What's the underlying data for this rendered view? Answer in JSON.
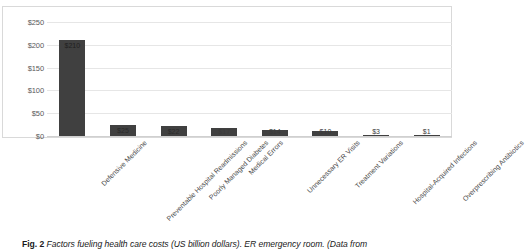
{
  "chart_data": {
    "type": "bar",
    "title": "",
    "xlabel": "",
    "ylabel": "",
    "ylim": [
      0,
      250
    ],
    "grid": true,
    "legend": "none",
    "y_ticks": [
      "$0",
      "$50",
      "$100",
      "$150",
      "$200",
      "$250"
    ],
    "y_tick_values": [
      0,
      50,
      100,
      150,
      200,
      250
    ],
    "categories": [
      "Defensive Medicine",
      "Preventable Hospital Readmissions",
      "Poorly Managed Diabetes",
      "Medical Errors",
      "Unnecessary ER Visits",
      "Treatment Variations",
      "Hospital-Acquired Infections",
      "Overprescribing Antibiotics"
    ],
    "values": [
      210,
      25,
      22,
      17,
      14,
      10,
      3,
      1
    ],
    "data_labels": [
      "$210",
      "$25",
      "$22",
      "$17",
      "$14",
      "$10",
      "$3",
      "$1"
    ],
    "bar_color": "#404040",
    "grid_color": "#e6e6e6"
  },
  "caption": {
    "figure_number": "Fig. 2",
    "text": "Factors fueling health care costs (US billion dollars). ER emergency room. (Data from"
  }
}
